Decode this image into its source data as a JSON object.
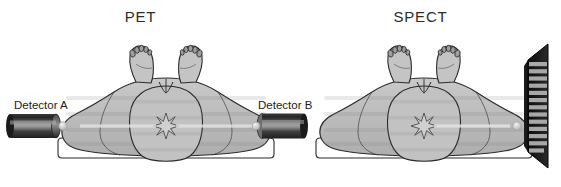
{
  "figure": {
    "kind": "medical-imaging-comparison-diagram",
    "panels": [
      {
        "id": "pet",
        "title": "PET",
        "title_x": 166,
        "modality": "Positron Emission Tomography",
        "detectors": [
          {
            "name": "Detector A",
            "label": "Detector A",
            "side": "left",
            "shape": "cylinder",
            "x": 10,
            "y": 114,
            "w": 48,
            "h": 24
          },
          {
            "name": "Detector B",
            "label": "Detector B",
            "side": "right",
            "shape": "cylinder",
            "x": 255,
            "y": 114,
            "w": 48,
            "h": 24
          }
        ],
        "ray": {
          "type": "coincidence-line",
          "from_x": 18,
          "to_x": 300,
          "y": 126,
          "color": "#d9d9d9"
        },
        "source": {
          "type": "star-burst",
          "points": 8,
          "x": 166,
          "y": 126
        },
        "patient": {
          "pose": "supine",
          "view": "from-feet",
          "fill": "#b9b9b9",
          "outline": "#2b2b2b"
        },
        "table": {
          "fill": "#ffffff",
          "outline": "#2b2b2b"
        }
      },
      {
        "id": "spect",
        "title": "SPECT",
        "title_x": 420,
        "modality": "Single Photon Emission Computed Tomography",
        "detectors": [
          {
            "name": "Collimated gamma camera",
            "label": "",
            "side": "right",
            "shape": "collimator-array",
            "x": 524,
            "y": 44,
            "w": 26,
            "h": 124,
            "septa_count": 15
          }
        ],
        "ray": {
          "type": "projection-line",
          "from_x": 430,
          "to_x": 528,
          "y": 126,
          "color": "#d9d9d9"
        },
        "source": {
          "type": "star-burst",
          "points": 8,
          "x": 424,
          "y": 126
        },
        "patient": {
          "pose": "supine",
          "view": "from-feet",
          "fill": "#b9b9b9",
          "outline": "#2b2b2b"
        },
        "table": {
          "fill": "#ffffff",
          "outline": "#2b2b2b"
        }
      }
    ],
    "colors": {
      "background": "#ffffff",
      "body_fill": "#b9b9b9",
      "body_fill_light": "#c6c6c6",
      "outline": "#2b2b2b",
      "detector_dark": "#2a2a2a",
      "detector_highlight": "#9a9a9a",
      "collimator_septa": "#a8a8a8",
      "collimator_body": "#101010",
      "ray": "#dcdcdc",
      "text": "#1c1c1c"
    }
  }
}
